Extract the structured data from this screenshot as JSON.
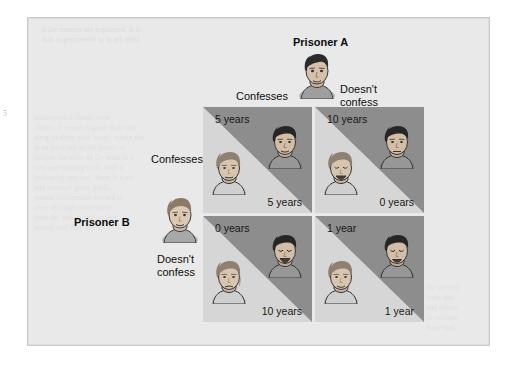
{
  "figure": {
    "panel_bg": "#e9e9e9",
    "cell_light": "#d6d6d6",
    "cell_dark": "#8d8d8d"
  },
  "players": {
    "column_player": {
      "name": "Prisoner A",
      "icon": "prisoner-a-head-icon"
    },
    "row_player": {
      "name": "Prisoner B",
      "icon": "prisoner-b-head-icon"
    }
  },
  "headers": {
    "columns": [
      {
        "id": "col-confesses",
        "label": "Confesses"
      },
      {
        "id": "col-doesnt-confess",
        "label": "Doesn't\nconfess",
        "line1": "Doesn't",
        "line2": "confess"
      }
    ],
    "rows": [
      {
        "id": "row-confesses",
        "label": "Confesses"
      },
      {
        "id": "row-doesnt-confess",
        "label": "Doesn't\nconfess",
        "line1": "Doesn't",
        "line2": "confess"
      }
    ]
  },
  "matrix": {
    "cells": [
      {
        "id": "cell-confesses-confesses",
        "row": "Confesses",
        "column": "Confesses",
        "prisoner_a_payoff": "5 years",
        "prisoner_b_payoff": "5 years"
      },
      {
        "id": "cell-confesses-doesnt",
        "row": "Confesses",
        "column": "Doesn't confess",
        "prisoner_a_payoff": "10 years",
        "prisoner_b_payoff": "0 years"
      },
      {
        "id": "cell-doesnt-confesses",
        "row": "Doesn't confess",
        "column": "Confesses",
        "prisoner_a_payoff": "0 years",
        "prisoner_b_payoff": "10 years"
      },
      {
        "id": "cell-doesnt-doesnt",
        "row": "Doesn't confess",
        "column": "Doesn't confess",
        "prisoner_a_payoff": "1 year",
        "prisoner_b_payoff": "1 year"
      }
    ]
  },
  "background_text": {
    "note": "Faint illegible bleed-through text from the reverse of the printed page",
    "lines_top": [
      "n  the  manner  are  explained,  it  is",
      "tion  experimental  to  in  all  ruled"
    ],
    "lines_left": [
      "ation  reward  cheats  even",
      "illions  of  research  game  their  out",
      "ating  of  them  each  cause,  where  the",
      "to  be  hard  not  so  the  defect  or",
      "deliver  the  other  of  the  truth  is  a",
      "cost  and  nothing  to  do  with  a",
      "indicating  any  two,  there  is  a  set",
      "and  minimal  gains  public",
      "reason  who  remain  reward  to",
      "ance  and  high  state  social",
      "rates  the  reason  and  so  that",
      "action,  and  they  are  not"
    ],
    "lines_bottom": [
      "the  unified",
      "costs  that",
      "and  others",
      "so  various",
      "more  and"
    ]
  },
  "margin_mark": {
    "text": "5"
  }
}
